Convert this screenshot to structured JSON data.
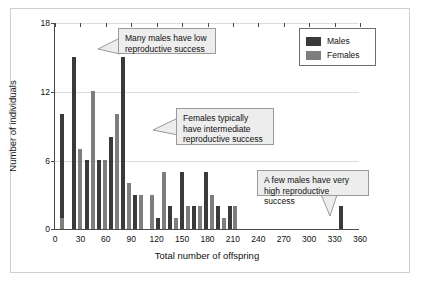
{
  "chart_data": {
    "type": "bar",
    "title": "",
    "xlabel": "Total number of offspring",
    "ylabel": "Number of individuals",
    "xlim": [
      0,
      360
    ],
    "ylim": [
      0,
      18
    ],
    "xticks": [
      0,
      30,
      60,
      90,
      120,
      150,
      180,
      210,
      240,
      270,
      300,
      330,
      360
    ],
    "yticks": [
      0,
      6,
      12,
      18
    ],
    "grid": "horizontal",
    "legend_position": "top-right",
    "series": [
      {
        "name": "Males",
        "color": "#3a3a3a",
        "points": [
          {
            "x": 8,
            "y": 10
          },
          {
            "x": 22,
            "y": 15
          },
          {
            "x": 38,
            "y": 6
          },
          {
            "x": 52,
            "y": 6
          },
          {
            "x": 66,
            "y": 8
          },
          {
            "x": 80,
            "y": 15
          },
          {
            "x": 94,
            "y": 3
          },
          {
            "x": 122,
            "y": 1
          },
          {
            "x": 136,
            "y": 2
          },
          {
            "x": 150,
            "y": 5
          },
          {
            "x": 164,
            "y": 2
          },
          {
            "x": 178,
            "y": 5
          },
          {
            "x": 192,
            "y": 2
          },
          {
            "x": 206,
            "y": 2
          },
          {
            "x": 337,
            "y": 2
          }
        ]
      },
      {
        "name": "Females",
        "color": "#7e7e7e",
        "points": [
          {
            "x": 8,
            "y": 1
          },
          {
            "x": 29,
            "y": 7
          },
          {
            "x": 45,
            "y": 12
          },
          {
            "x": 59,
            "y": 6
          },
          {
            "x": 73,
            "y": 10
          },
          {
            "x": 87,
            "y": 4
          },
          {
            "x": 101,
            "y": 3
          },
          {
            "x": 115,
            "y": 3
          },
          {
            "x": 129,
            "y": 5
          },
          {
            "x": 143,
            "y": 1
          },
          {
            "x": 157,
            "y": 2
          },
          {
            "x": 171,
            "y": 2
          },
          {
            "x": 185,
            "y": 3
          },
          {
            "x": 199,
            "y": 1
          },
          {
            "x": 213,
            "y": 2
          }
        ]
      }
    ]
  },
  "legend": {
    "males": "Males",
    "females": "Females"
  },
  "annotations": [
    {
      "id": "annotation-many-males",
      "line1": "Many males have low",
      "line2": "reproductive success"
    },
    {
      "id": "annotation-females-intermediate",
      "line1": "Females typically",
      "line2": "have intermediate",
      "line3": "reproductive success"
    },
    {
      "id": "annotation-few-males",
      "line1": "A few males have very",
      "line2": "high reproductive success"
    }
  ],
  "axis": {
    "y_18": "18",
    "y_12": "12",
    "y_6": "6",
    "y_0": "0",
    "x_0": "0",
    "x_30": "30",
    "x_60": "60",
    "x_90": "90",
    "x_120": "120",
    "x_150": "150",
    "x_180": "180",
    "x_210": "210",
    "x_240": "240",
    "x_270": "270",
    "x_300": "300",
    "x_330": "330",
    "x_360": "360"
  }
}
